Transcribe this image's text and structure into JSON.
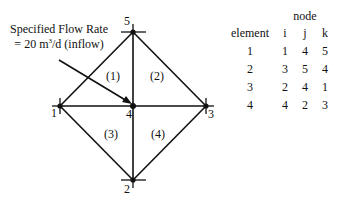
{
  "annotation": {
    "line1": "Specified Flow Rate",
    "line2_prefix": "= 20 m",
    "line2_sup": "3",
    "line2_suffix": "/d (inflow)",
    "arrow_target_node": "4"
  },
  "nodes": [
    {
      "id": "1",
      "x": 60,
      "y": 106
    },
    {
      "id": "2",
      "x": 133,
      "y": 180
    },
    {
      "id": "3",
      "x": 206,
      "y": 106
    },
    {
      "id": "4",
      "x": 133,
      "y": 106
    },
    {
      "id": "5",
      "x": 133,
      "y": 32
    }
  ],
  "element_labels": [
    "(1)",
    "(2)",
    "(3)",
    "(4)"
  ],
  "table": {
    "group_header": "node",
    "columns": [
      "element",
      "i",
      "j",
      "k"
    ],
    "rows": [
      [
        "1",
        "1",
        "4",
        "5"
      ],
      [
        "2",
        "3",
        "5",
        "4"
      ],
      [
        "3",
        "2",
        "4",
        "1"
      ],
      [
        "4",
        "4",
        "2",
        "3"
      ]
    ]
  },
  "colors": {
    "line": "#111111",
    "background": "#ffffff"
  }
}
